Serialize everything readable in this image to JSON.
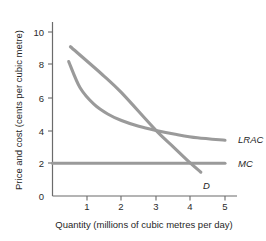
{
  "chart_data": {
    "type": "line",
    "title": "",
    "xlabel": "Quantity (millions of cubic metres per day)",
    "ylabel": "Price and cost (cents per cubic metre)",
    "xlim": [
      0,
      5.4
    ],
    "ylim": [
      0,
      11
    ],
    "xticks": [
      "0",
      "1",
      "2",
      "3",
      "4",
      "5"
    ],
    "xtick_values": [
      0,
      1,
      2,
      3,
      4,
      5
    ],
    "yticks": [
      "2",
      "4",
      "6",
      "8",
      "10"
    ],
    "ytick_values": [
      2,
      4,
      6,
      8,
      10
    ],
    "ytick_zero": "0",
    "grid": false,
    "legend_position": "right-inline",
    "series": [
      {
        "name": "D",
        "label": "D",
        "type": "line",
        "color": "#9a9a9a",
        "points": [
          [
            0.52,
            9.1
          ],
          [
            1.5,
            7.3
          ],
          [
            2.0,
            6.3
          ],
          [
            3.0,
            4.0
          ],
          [
            3.5,
            3.0
          ],
          [
            4.0,
            2.0
          ],
          [
            4.3,
            1.45
          ]
        ]
      },
      {
        "name": "LRAC",
        "label": "LRAC",
        "type": "line",
        "color": "#9a9a9a",
        "points": [
          [
            0.47,
            8.2
          ],
          [
            0.8,
            6.6
          ],
          [
            1.2,
            5.6
          ],
          [
            1.6,
            5.0
          ],
          [
            2.0,
            4.6
          ],
          [
            2.5,
            4.25
          ],
          [
            3.0,
            4.0
          ],
          [
            3.6,
            3.75
          ],
          [
            4.2,
            3.55
          ],
          [
            5.0,
            3.4
          ]
        ]
      },
      {
        "name": "MC",
        "label": "MC",
        "type": "line",
        "color": "#9a9a9a",
        "points": [
          [
            0.0,
            2.0
          ],
          [
            5.0,
            2.0
          ]
        ]
      }
    ],
    "annotations": [
      {
        "text": "LRAC",
        "x": 5.25,
        "y": 3.4
      },
      {
        "text": "MC",
        "x": 5.25,
        "y": 2.0
      },
      {
        "text": "D",
        "x": 4.4,
        "y": 1.0
      }
    ]
  },
  "colors": {
    "curve": "#9a9a9a",
    "axis": "#6b6b6b",
    "text": "#1f1f1f",
    "background": "#ffffff"
  }
}
